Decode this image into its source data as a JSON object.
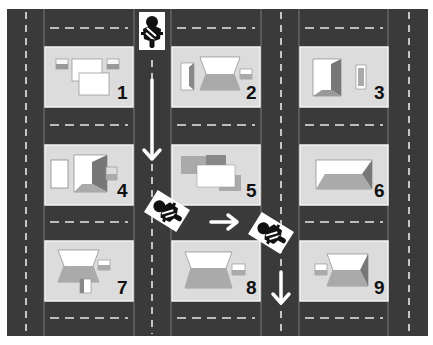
{
  "map": {
    "road_color": "#3a3a3a",
    "lot_color": "#dcdcdc",
    "lot_border": "#f0f0f0",
    "marking_color": "#e8e8e8"
  },
  "blocks": [
    {
      "number": "1",
      "house": "two flat-roof buildings with two small sheds"
    },
    {
      "number": "2",
      "house": "hip-roof house with garage and side annex"
    },
    {
      "number": "3",
      "house": "hip-roof house with small shed"
    },
    {
      "number": "4",
      "house": "flat shed with hip-roof house and annex"
    },
    {
      "number": "5",
      "house": "overlapping flat-roof buildings"
    },
    {
      "number": "6",
      "house": "hip-roof house"
    },
    {
      "number": "7",
      "house": "hip-roof house with two annexes"
    },
    {
      "number": "8",
      "house": "hip-roof house with annex on right"
    },
    {
      "number": "9",
      "house": "hip-roof house with annex on left"
    }
  ],
  "route": {
    "description": "Motorcycle starts at top between block 1 and 2, goes down, turns right between blocks 5 and 8, then turns down between blocks 8 and 9",
    "arrows": [
      "down",
      "right",
      "down"
    ],
    "motorcycle_icons": 3
  }
}
